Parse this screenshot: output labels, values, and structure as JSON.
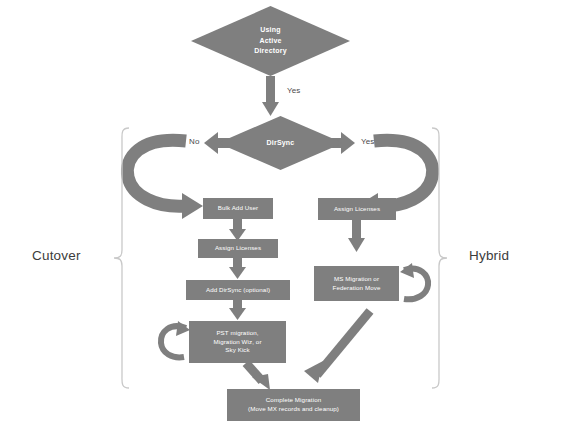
{
  "diagram": {
    "background_color": "#ffffff",
    "shape_color": "#7f7f7f",
    "text_color": "#ffffff",
    "label_color": "#3c3c3c"
  },
  "decisions": {
    "root": {
      "line1": "Using",
      "line2": "Active",
      "line3": "Directory"
    },
    "dirsync": {
      "label": "DirSync"
    }
  },
  "edge_labels": {
    "root_yes": "Yes",
    "dirsync_no": "No",
    "dirsync_yes": "Yes"
  },
  "brackets": {
    "left_label": "Cutover",
    "right_label": "Hybrid"
  },
  "cutover_path": [
    {
      "id": "bulk-add-user",
      "text": "Bulk Add User"
    },
    {
      "id": "assign-licenses-left",
      "text": "Assign Licenses"
    },
    {
      "id": "add-dirsync",
      "text": "Add DirSync (optional)"
    },
    {
      "id": "pst-migration",
      "line1": "PST migration,",
      "line2": "Migration Wiz, or",
      "line3": "Sky Kick"
    }
  ],
  "hybrid_path": [
    {
      "id": "assign-licenses-right",
      "text": "Assign Licenses"
    },
    {
      "id": "ms-migration",
      "line1": "MS Migration or",
      "line2": "Federation Move"
    }
  ],
  "final": {
    "line1": "Complete Migration",
    "line2": "(Move MX records and cleanup)"
  }
}
